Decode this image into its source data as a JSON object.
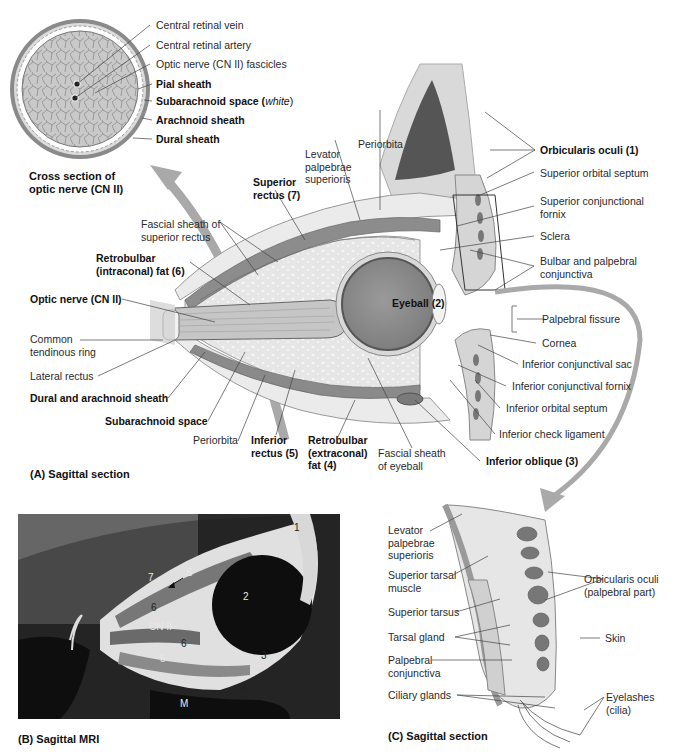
{
  "panel_a": {
    "caption": "(A) Sagittal section",
    "cross_section": {
      "caption_line1": "Cross section of",
      "caption_line2": "optic nerve (CN II)",
      "labels": {
        "central_retinal_vein": "Central retinal vein",
        "central_retinal_artery": "Central retinal artery",
        "optic_nerve_fascicles": "Optic nerve (CN II) fascicles",
        "pial_sheath": "Pial sheath",
        "subarachnoid_space": "Subarachnoid space (",
        "subarachnoid_white": "white",
        "subarachnoid_close": ")",
        "arachnoid_sheath": "Arachnoid sheath",
        "dural_sheath": "Dural sheath"
      }
    },
    "labels": {
      "periorbita_top": "Periorbita",
      "levator_l1": "Levator",
      "levator_l2": "palpebrae",
      "levator_l3": "superioris",
      "superior_rectus_l1": "Superior",
      "superior_rectus_l2": "rectus (7)",
      "fascial_sheath_sr_l1": "Fascial sheath of",
      "fascial_sheath_sr_l2": "superior rectus",
      "retrobulbar_intra_l1": "Retrobulbar",
      "retrobulbar_intra_l2": "(intraconal) fat (6)",
      "optic_nerve": "Optic nerve (CN II)",
      "common_tendinous_l1": "Common",
      "common_tendinous_l2": "tendinous ring",
      "lateral_rectus": "Lateral rectus",
      "dural_arachnoid": "Dural and arachnoid sheath",
      "subarachnoid_space": "Subarachnoid space",
      "periorbita_bottom": "Periorbita",
      "inferior_rectus_l1": "Inferior",
      "inferior_rectus_l2": "rectus (5)",
      "retrobulbar_extra_l1": "Retrobulbar",
      "retrobulbar_extra_l2": "(extraconal)",
      "retrobulbar_extra_l3": "fat (4)",
      "fascial_sheath_eye_l1": "Fascial sheath",
      "fascial_sheath_eye_l2": "of eyeball",
      "eyeball": "Eyeball (2)",
      "orbicularis_oculi": "Orbicularis oculi (1)",
      "superior_orbital_septum": "Superior orbital septum",
      "superior_conj_fornix_l1": "Superior conjunctional",
      "superior_conj_fornix_l2": "fornix",
      "sclera": "Sclera",
      "bulbar_palpebral_l1": "Bulbar and palpebral",
      "bulbar_palpebral_l2": "conjunctiva",
      "palpebral_fissure": "Palpebral fissure",
      "cornea": "Cornea",
      "inferior_conj_sac": "Inferior conjunctival sac",
      "inferior_conj_fornix": "Inferior conjunctival fornix",
      "inferior_orbital_septum": "Inferior orbital septum",
      "inferior_check_ligament": "Inferior check ligament",
      "inferior_oblique": "Inferior oblique (3)"
    }
  },
  "panel_b": {
    "caption": "(B) Sagittal MRI",
    "labels": {
      "n1": "1",
      "n2": "2",
      "n3": "3",
      "n4": "4",
      "n5": "5",
      "n6a": "6",
      "n6b": "6",
      "n7": "7",
      "s": "S",
      "cn2": "CN II",
      "m": "M",
      "c": "C"
    }
  },
  "panel_c": {
    "caption": "(C) Sagittal section",
    "labels": {
      "levator_l1": "Levator",
      "levator_l2": "palpebrae",
      "levator_l3": "superioris",
      "sup_tarsal_muscle_l1": "Superior tarsal",
      "sup_tarsal_muscle_l2": "muscle",
      "superior_tarsus": "Superior tarsus",
      "tarsal_gland": "Tarsal gland",
      "palpebral_conj_l1": "Palpebral",
      "palpebral_conj_l2": "conjunctiva",
      "ciliary_glands": "Ciliary glands",
      "orbicularis_l1": "Orbicularis oculi",
      "orbicularis_l2": "(palpebral part)",
      "skin": "Skin",
      "eyelashes_l1": "Eyelashes",
      "eyelashes_l2": "(cilia)"
    }
  },
  "colors": {
    "muscle": "#8a8a8a",
    "eyeball": "#8f8f8f",
    "fat": "#e4e4e4",
    "arrow": "#a8a8a8",
    "mri_bg": "#1a1a1a"
  }
}
